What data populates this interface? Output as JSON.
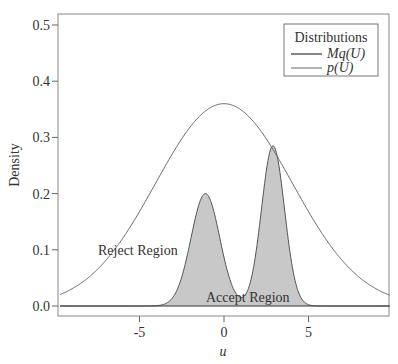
{
  "chart_data": {
    "type": "line",
    "title": "",
    "xlabel": "u",
    "ylabel": "Density",
    "xlim": [
      -9.7,
      9.8
    ],
    "ylim": [
      -0.017,
      0.52
    ],
    "grid": false,
    "x_ticks": [
      -5,
      0,
      5
    ],
    "x_tick_labels": [
      "-5",
      "0",
      "5"
    ],
    "y_ticks": [
      0.0,
      0.1,
      0.2,
      0.3,
      0.4,
      0.5
    ],
    "y_tick_labels": [
      "0.0",
      "0.1",
      "0.2",
      "0.3",
      "0.4",
      "0.5"
    ],
    "legend": {
      "title": "Distributions",
      "position": "top-right",
      "entries": [
        "Mq(U)",
        "p(U)"
      ]
    },
    "series": [
      {
        "name": "Mq(U)",
        "description": "scaled normal envelope, mean 0, sd 4, peak ~0.36",
        "x": [
          -9.7,
          -8,
          -6,
          -4,
          -2,
          0,
          2,
          4,
          6,
          8,
          9.8
        ],
        "values": [
          0.058,
          0.097,
          0.16,
          0.235,
          0.318,
          0.36,
          0.318,
          0.235,
          0.16,
          0.097,
          0.054
        ]
      },
      {
        "name": "p(U)",
        "description": "bimodal target density, shaded below as Accept Region",
        "x": [
          -9.7,
          -5,
          -4,
          -3,
          -2,
          -1.1,
          0,
          1.0,
          2,
          2.9,
          4,
          5,
          9.8
        ],
        "values": [
          0.0,
          0.001,
          0.01,
          0.05,
          0.15,
          0.2,
          0.11,
          0.035,
          0.15,
          0.285,
          0.08,
          0.003,
          0.0
        ]
      }
    ],
    "annotations": [
      {
        "text": "Reject Region",
        "x": -5.5,
        "y": 0.1
      },
      {
        "text": "Accept Region",
        "x": 1.0,
        "y": 0.012
      }
    ]
  }
}
